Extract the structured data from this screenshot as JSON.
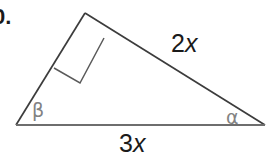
{
  "figure": {
    "type": "right-triangle-diagram",
    "background_color": "#ffffff",
    "item_number": "0.",
    "line_color": "#3c3c3c",
    "greek_color": "#828282",
    "label_color": "#1a1a1a",
    "vertices": {
      "apex": {
        "x": 85,
        "y": 13
      },
      "bottom_left": {
        "x": 16,
        "y": 125
      },
      "bottom_right": {
        "x": 265,
        "y": 125
      }
    },
    "right_angle_marker": {
      "at_vertex": "apex",
      "points": "85,13 52,71 78,85 104,35"
    },
    "sides": [
      {
        "name": "hypotenuse",
        "label_prefix": "2",
        "label_variable": "x",
        "label_full": "2x"
      },
      {
        "name": "base",
        "label_prefix": "3",
        "label_variable": "x",
        "label_full": "3x"
      },
      {
        "name": "left-leg",
        "label_prefix": "",
        "label_variable": "",
        "label_full": ""
      }
    ],
    "angles": [
      {
        "name": "beta",
        "symbol": "β",
        "at_vertex": "bottom_left"
      },
      {
        "name": "alpha",
        "symbol": "α",
        "at_vertex": "bottom_right"
      }
    ]
  }
}
